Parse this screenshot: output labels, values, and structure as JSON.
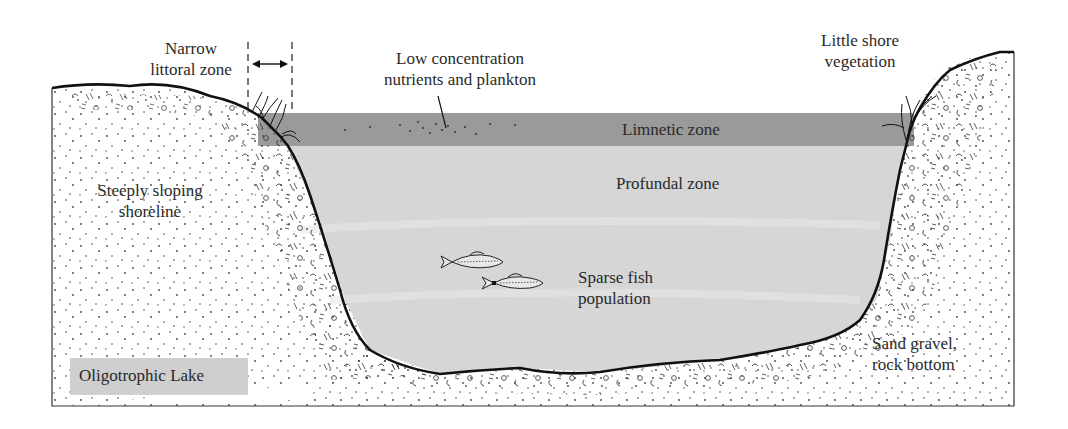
{
  "title": "Oligotrophic Lake",
  "labels": {
    "narrow_littoral_line1": "Narrow",
    "narrow_littoral_line2": "littoral zone",
    "nutrients_line1": "Low concentration",
    "nutrients_line2": "nutrients and plankton",
    "shore_veg_line1": "Little shore",
    "shore_veg_line2": "vegetation",
    "limnetic": "Limnetic zone",
    "profundal": "Profundal  zone",
    "shoreline_line1": "Steeply sloping",
    "shoreline_line2": "shoreline",
    "fish_line1": "Sparse fish",
    "fish_line2": "population",
    "bottom_line1": "Sand gravel,",
    "bottom_line2": "rock bottom"
  },
  "legend": {
    "label": "Oligotrophic  Lake"
  },
  "colors": {
    "limnetic": "#9a9a9a",
    "profundal": "#d6d6d6",
    "legend_bg": "#cfcfcf",
    "outline": "#111111",
    "text": "#2a2a2a"
  },
  "icons": [
    "grass-tuft-icon",
    "fish-icon",
    "double-arrow-icon",
    "plankton-dots"
  ]
}
